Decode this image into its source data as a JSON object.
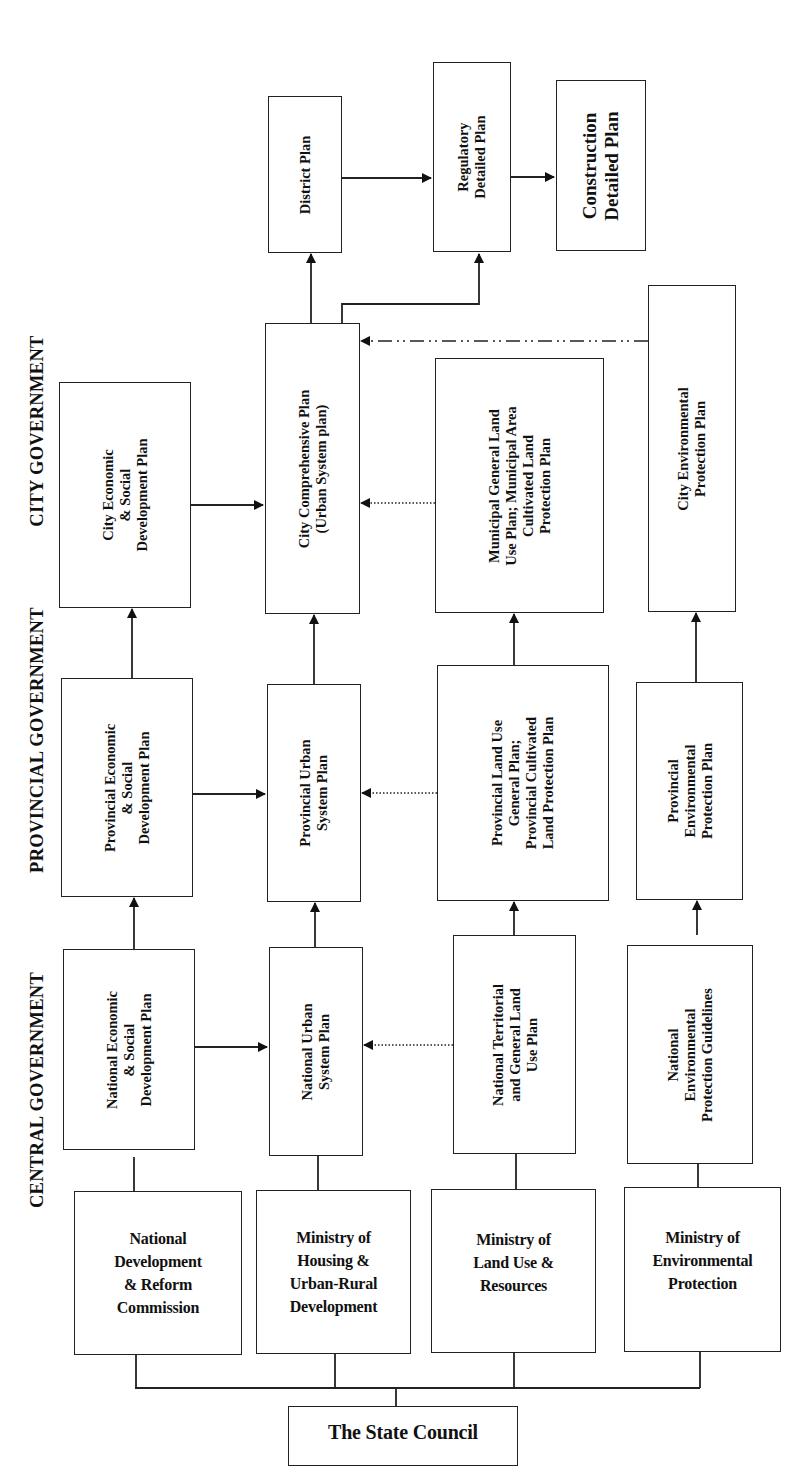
{
  "levels": {
    "city": "CITY GOVERNMENT",
    "provincial": "PROVINCIAL GOVERNMENT",
    "central": "CENTRAL GOVERNMENT"
  },
  "city": {
    "district_plan": "District Plan",
    "regulatory_plan": "Regulatory\nDetailed Plan",
    "construction_plan": "Construction\nDetailed Plan",
    "economic_plan": "City Economic\n& Social\nDevelopment Plan",
    "comprehensive_plan": "City Comprehensive Plan\n(Urban System plan)",
    "land_use_plan": "Municipal General Land\nUse Plan; Municipal Area\nCultivated Land\nProtection Plan",
    "environmental_plan": "City Environmental\nProtection Plan"
  },
  "provincial": {
    "economic_plan": "Provincial Economic\n& Social\nDevelopment Plan",
    "urban_system_plan": "Provincial Urban\nSystem Plan",
    "land_use_plan": "Provincial Land Use\nGeneral Plan;\nProvincial Cultivated\nLand Protection Plan",
    "environmental_plan": "Provincial\nEnvironmental\nProtection Plan"
  },
  "central": {
    "economic_plan": "National Economic\n& Social\nDevelopment Plan",
    "urban_system_plan": "National Urban\nSystem Plan",
    "land_use_plan": "National Territorial\nand General Land\nUse Plan",
    "environmental_guidelines": "National\nEnvironmental\nProtection Guidelines"
  },
  "agencies": [
    {
      "label": "National\nDevelopment\n& Reform\nCommission"
    },
    {
      "label": "Ministry of\nHousing &\nUrban-Rural\nDevelopment"
    },
    {
      "label": "Ministry of\nLand Use &\nResources"
    },
    {
      "label": "Ministry of\nEnvironmental\nProtection"
    }
  ],
  "root": {
    "label": "The State Council"
  },
  "colors": {
    "line": "#222222",
    "background": "#ffffff"
  }
}
